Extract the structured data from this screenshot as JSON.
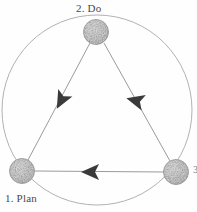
{
  "diagram": {
    "title": "",
    "type": "cycle-diagram",
    "shape": "triangle-in-circle",
    "colors": {
      "background": "#fefefe",
      "node_fill": "#b9b9b9",
      "node_speckle": "#6e6e6e",
      "edge_line": "#8f8f8f",
      "circle_line": "#a8a8a8",
      "arrowhead": "#3a3a3a",
      "label_text": "#4a4a4a"
    },
    "nodes": [
      {
        "id": "plan",
        "label": "1. Plan",
        "cx": 22,
        "cy": 171,
        "r": 12.5,
        "label_position": "bottom-left"
      },
      {
        "id": "do",
        "label": "2. Do",
        "cx": 96,
        "cy": 32,
        "r": 12.5,
        "label_position": "top"
      },
      {
        "id": "check",
        "label": "3",
        "cx": 176,
        "cy": 172,
        "r": 12.5,
        "label_position": "right-cropped"
      }
    ],
    "edges": [
      {
        "id": "edge-do-to-plan",
        "from": "do",
        "to": "plan",
        "direction": "down-left",
        "arrow_at": {
          "x": 62,
          "y": 99
        }
      },
      {
        "id": "edge-do-to-check",
        "from": "do",
        "to": "check",
        "direction": "down-right",
        "arrow_at": {
          "x": 136,
          "y": 101
        }
      },
      {
        "id": "edge-check-to-plan",
        "from": "check",
        "to": "plan",
        "direction": "left",
        "arrow_at": {
          "x": 92,
          "y": 172
        }
      }
    ],
    "outer_circle": {
      "cx": 97,
      "cy": 110,
      "r": 95
    }
  }
}
